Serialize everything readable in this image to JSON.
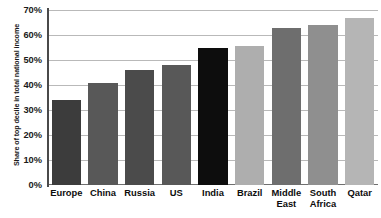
{
  "chart_data": {
    "type": "bar",
    "title": "",
    "subtitle": "",
    "xlabel": "",
    "ylabel": "Share of top decile in total national income",
    "ylim": [
      0,
      70
    ],
    "ytick_values": [
      0,
      10,
      20,
      30,
      40,
      50,
      60,
      70
    ],
    "ytick_labels": [
      "0%",
      "10%",
      "20%",
      "30%",
      "40%",
      "50%",
      "60%",
      "70%"
    ],
    "grid": true,
    "legend": "none",
    "categories": [
      "Europe",
      "China",
      "Russia",
      "US",
      "India",
      "Brazil",
      "Middle\nEast",
      "South\nAfrica",
      "Qatar"
    ],
    "values": [
      34,
      41,
      46,
      48,
      55,
      55.5,
      63,
      64,
      67
    ],
    "bar_colors": [
      "#3c3c3c",
      "#585858",
      "#4b4b4b",
      "#585858",
      "#0d0d0d",
      "#aeaeae",
      "#6e6e6e",
      "#8f8f8f",
      "#b5b5b5"
    ],
    "axis_color": "#4a4a4a",
    "grid_color": "#b9b9b9",
    "background_color": "#ffffff",
    "text_color": "#1a1a1a"
  }
}
